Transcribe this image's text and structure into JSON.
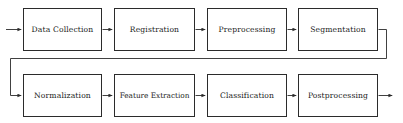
{
  "diagram": {
    "orientation": "left-to-right, two rows with wrap connector",
    "style": {
      "background_color": "#ffffff",
      "box_fill_color": "#ffffff",
      "box_border_color": "#2b2b2b",
      "line_color": "#2b2b2b",
      "text_color": "#1a1a1a"
    },
    "rows": [
      {
        "row_index": 0,
        "nodes": [
          {
            "id": "data-collection",
            "label": "Data Collection",
            "x": 23,
            "y": 8,
            "width": 79,
            "height": 43
          },
          {
            "id": "registration",
            "label": "Registration",
            "x": 114,
            "y": 8,
            "width": 81,
            "height": 43
          },
          {
            "id": "preprocessing",
            "label": "Preprocessing",
            "x": 207,
            "y": 8,
            "width": 80,
            "height": 43
          },
          {
            "id": "segmentation",
            "label": "Segmentation",
            "x": 298,
            "y": 8,
            "width": 80,
            "height": 43
          }
        ]
      },
      {
        "row_index": 1,
        "nodes": [
          {
            "id": "normalization",
            "label": "Normalization",
            "x": 23,
            "y": 74,
            "width": 79,
            "height": 43
          },
          {
            "id": "feature-extraction",
            "label": "Feature Extraction",
            "x": 114,
            "y": 74,
            "width": 81,
            "height": 43
          },
          {
            "id": "classification",
            "label": "Classification",
            "x": 207,
            "y": 74,
            "width": 80,
            "height": 43
          },
          {
            "id": "postprocessing",
            "label": "Postprocessing",
            "x": 298,
            "y": 74,
            "width": 80,
            "height": 43
          }
        ]
      }
    ],
    "connectors": [
      {
        "id": "entry-arrow",
        "from": "input",
        "to": "data-collection",
        "kind": "arrow",
        "direction": "right"
      },
      {
        "id": "data-collection-to-registration",
        "from": "data-collection",
        "to": "registration",
        "kind": "arrow",
        "direction": "right"
      },
      {
        "id": "registration-to-preprocessing",
        "from": "registration",
        "to": "preprocessing",
        "kind": "arrow",
        "direction": "right"
      },
      {
        "id": "preprocessing-to-segmentation",
        "from": "preprocessing",
        "to": "segmentation",
        "kind": "arrow",
        "direction": "right"
      },
      {
        "id": "segmentation-to-normalization",
        "from": "segmentation",
        "to": "normalization",
        "kind": "wrap-arrow",
        "direction": "right-down-left-down-right"
      },
      {
        "id": "normalization-to-feature-extraction",
        "from": "normalization",
        "to": "feature-extraction",
        "kind": "arrow",
        "direction": "right"
      },
      {
        "id": "feature-extraction-to-classification",
        "from": "feature-extraction",
        "to": "classification",
        "kind": "arrow",
        "direction": "right"
      },
      {
        "id": "classification-to-postprocessing",
        "from": "classification",
        "to": "postprocessing",
        "kind": "arrow",
        "direction": "right"
      },
      {
        "id": "exit-arrow",
        "from": "postprocessing",
        "to": "output",
        "kind": "arrow",
        "direction": "right"
      }
    ]
  }
}
